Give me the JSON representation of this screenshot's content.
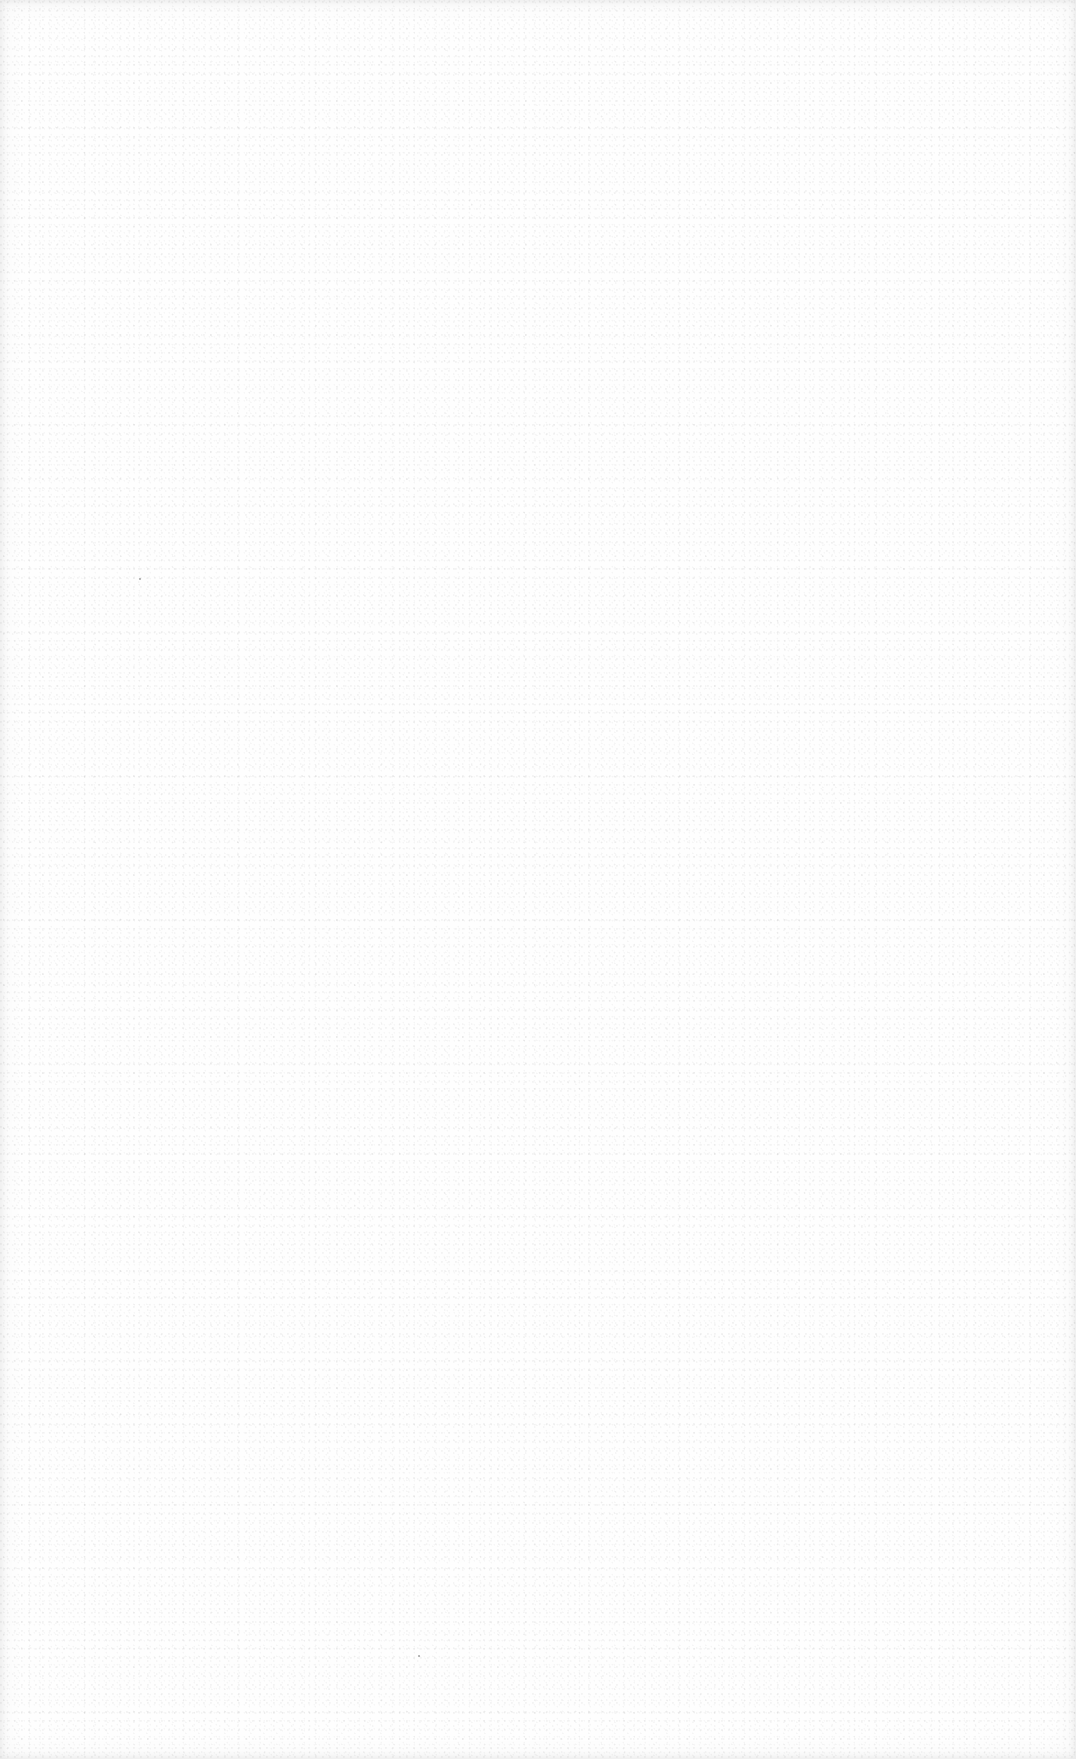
{
  "page": {
    "background_color": "#fefefe",
    "speckle_color": "#d9d9d9",
    "edge_color": "#ececec"
  },
  "marks": [
    {
      "type": "stray-dot",
      "x": 139,
      "y": 578
    },
    {
      "type": "stray-dot",
      "x": 418,
      "y": 1655
    }
  ]
}
